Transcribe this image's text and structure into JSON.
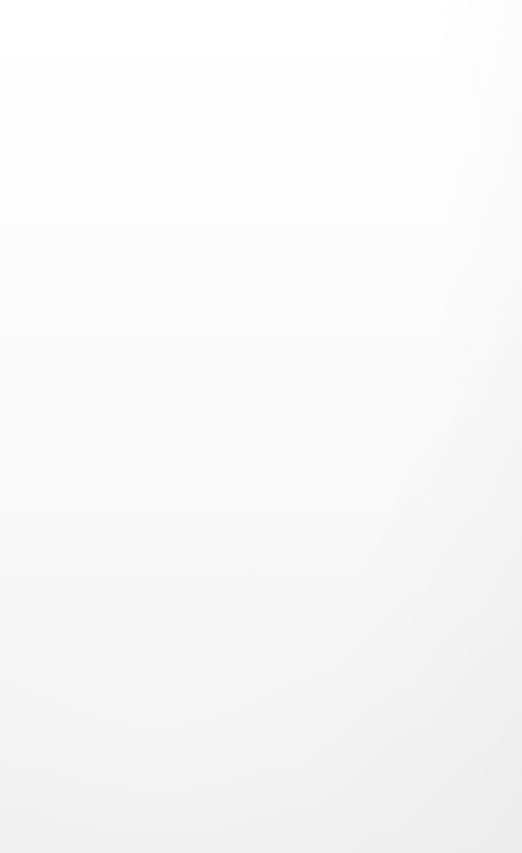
{
  "document": {
    "kind": "hand-drawn-mind-map",
    "orientation": "rotated-90-ccw",
    "center_topic": "PRESENTATION",
    "ink_color": "#141414",
    "paper_color": "#fbfbfb"
  },
  "center": {
    "label": "PRESENTATION",
    "sketch_name": "presenter-and-audience-sketch"
  },
  "branches": {
    "memory": {
      "label": "MEMORY",
      "children": [
        {
          "label": "REPETITION"
        },
        {
          "label": "SUPPORT"
        },
        {
          "label": "ASSOCIATION"
        },
        {
          "label": "INTENSITY"
        },
        {
          "label": "INVOLVEMENT"
        }
      ]
    },
    "position": {
      "label": "POSITION",
      "children": [
        {
          "label": "BEGINNING"
        },
        {
          "label": "END"
        }
      ]
    },
    "pace": {
      "label": "PACE",
      "children": [
        {
          "label": "CHANGE"
        }
      ]
    },
    "visual_aids": {
      "label": "VISUAL AIDS",
      "children": [
        {
          "label": "DO- DON'T"
        },
        {
          "label": "MATCH"
        },
        {
          "label": "GROUP"
        }
      ]
    },
    "equipment": {
      "label": "EQUIPMENT",
      "children": [
        {
          "label": "BEST USE"
        },
        {
          "label": "DISADVANTAGES"
        },
        {
          "label": "ADVANTAGES"
        }
      ]
    },
    "purpose": {
      "label": "PURPOSE",
      "children": [
        {
          "label": "INFORM ?"
        },
        {
          "label": "ENTERTAIN ?"
        },
        {
          "label": "MOTIVATE ?"
        }
      ]
    },
    "organize": {
      "label": "ORGANIZE"
    },
    "images": {
      "label": "IMAGES"
    },
    "color": {
      "label": "COLOR"
    },
    "fear": {
      "label_line1": "FEAR",
      "label_line2": "#1",
      "shape_name": "starburst"
    },
    "map_box": {
      "label": "MAP",
      "compass": {
        "north": "N",
        "south": "S",
        "east": "E",
        "west": "W"
      },
      "sketch_name": "brain-sketch"
    },
    "big_idea": {
      "label": "BIG IDEA"
    }
  }
}
